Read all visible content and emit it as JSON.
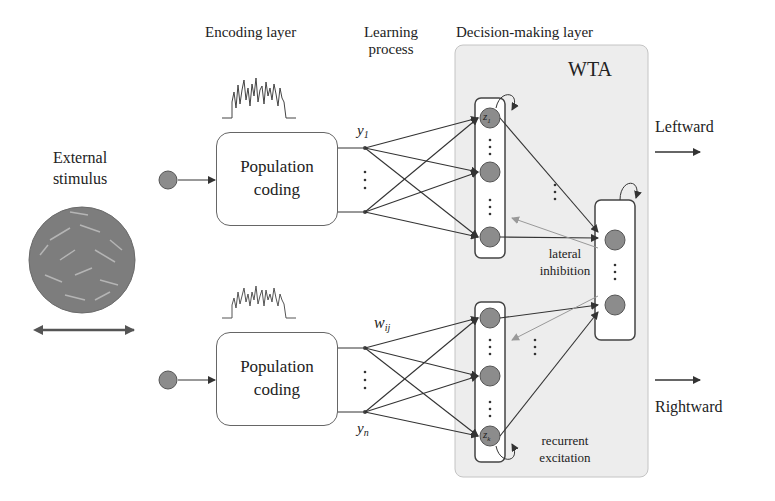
{
  "headers": {
    "encoding": "Encoding layer",
    "learning_line1": "Learning",
    "learning_line2": "process",
    "decision": "Decision-making layer"
  },
  "stimulus": {
    "line1": "External",
    "line2": "stimulus"
  },
  "population_top": {
    "line1": "Population",
    "line2": "coding"
  },
  "population_bottom": {
    "line1": "Population",
    "line2": "coding"
  },
  "variables": {
    "y1": "y",
    "y1_sub": "1",
    "yn": "y",
    "yn_sub": "n",
    "wij": "w",
    "wij_sub": "ij",
    "z1": "z",
    "z1_sub": "1",
    "zk": "z",
    "zk_sub": "k"
  },
  "wta_label": "WTA",
  "annotations": {
    "lateral1": "lateral",
    "lateral2": "inhibition",
    "recurrent1": "recurrent",
    "recurrent2": "excitation"
  },
  "outputs": {
    "left": "Leftward",
    "right": "Rightward"
  },
  "colors": {
    "neuron_fill": "#8c8c8c",
    "neuron_stroke": "#555555",
    "wta_bg": "#ededed",
    "wta_border": "#bdbdbd",
    "stimulus_fill": "#7d7d7d",
    "arrow": "#333333",
    "lateral_arrow": "#999999"
  }
}
